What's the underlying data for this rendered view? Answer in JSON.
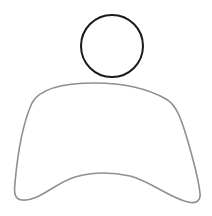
{
  "figure": {
    "head": {
      "shape": "circle",
      "cx": 112,
      "cy": 46,
      "r": 31,
      "stroke": "#1a1a1a",
      "stroke_width": 2
    },
    "body": {
      "shape": "path",
      "d": "M 32 103 C 40 88, 65 83, 95 83 C 125 83, 150 90, 166 99 C 175 104, 180 115, 186 135 C 192 155, 198 175, 200 193 C 201 201, 196 204, 188 202 C 170 198, 150 181, 130 176 C 112 172, 92 172, 75 177 C 55 183, 38 202, 22 200 C 14 199, 14 192, 15 183 C 17 160, 22 125, 32 103 Z",
      "stroke": "#8f8f8f",
      "stroke_width": 1.6
    }
  }
}
